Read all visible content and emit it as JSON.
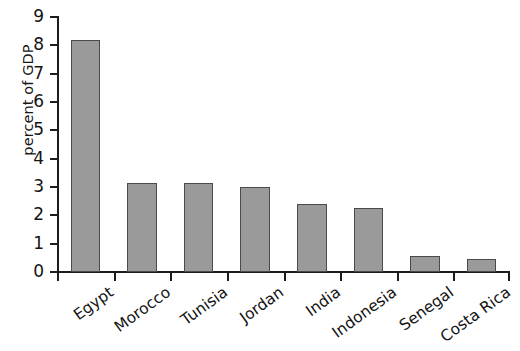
{
  "chart_data": {
    "type": "bar",
    "title": "",
    "subtitle": "",
    "xlabel": "",
    "ylabel": "percent of GDP",
    "categories": [
      "Egypt",
      "Morocco",
      "Tunisia",
      "Jordan",
      "India",
      "Indonesia",
      "Senegal",
      "Costa Rica"
    ],
    "values": [
      8.2,
      3.15,
      3.15,
      3.0,
      2.4,
      2.25,
      0.55,
      0.45
    ],
    "ylim": [
      0,
      9
    ],
    "ytick_labels": [
      "9",
      "8",
      "7",
      "6",
      "5",
      "4",
      "3",
      "2",
      "1",
      "0"
    ],
    "ytick_values": [
      9,
      8,
      7,
      6,
      5,
      4,
      3,
      2,
      1,
      0
    ],
    "grid": false,
    "legend": false,
    "bar_color": "#9a9a9a",
    "bar_border_color": "#4a4a4a",
    "axis_color": "#1c1c1c",
    "background": "#ffffff"
  }
}
